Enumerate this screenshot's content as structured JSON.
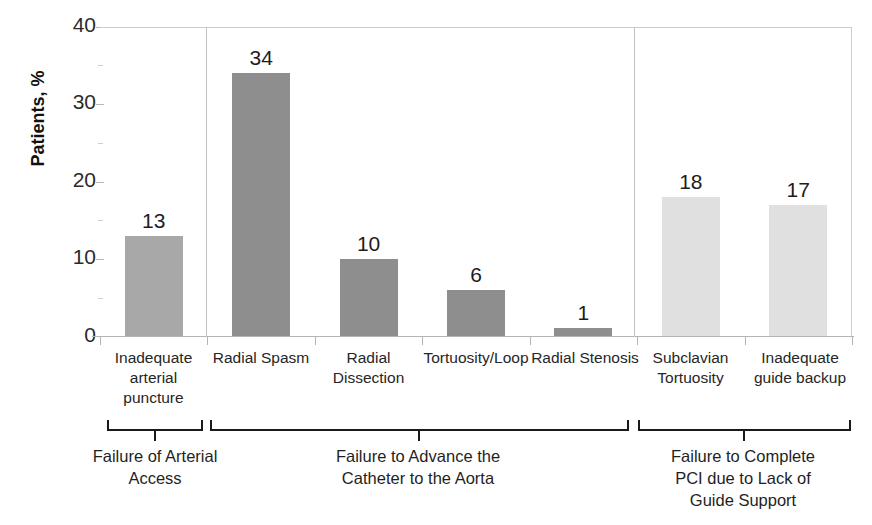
{
  "chart_data": {
    "type": "bar",
    "title": "",
    "subtitle": "",
    "xlabel": "",
    "ylabel": "Patients, %",
    "ylim": [
      0,
      40
    ],
    "ytick_labels": [
      "0",
      "10",
      "20",
      "30",
      "40"
    ],
    "ytick_values": [
      0,
      10,
      20,
      30,
      40
    ],
    "grid": false,
    "legend": "none",
    "categories": [
      "Inadequate arterial puncture",
      "Radial Spasm",
      "Radial Dissection",
      "Tortuosity/Loop",
      "Radial Stenosis",
      "Subclavian Tortuosity",
      "Inadequate guide backup"
    ],
    "values": [
      13,
      34,
      10,
      6,
      1,
      18,
      17
    ],
    "data_labels": [
      "13",
      "34",
      "10",
      "6",
      "1",
      "18",
      "17"
    ],
    "bar_colors": [
      "#a8a8a8",
      "#8e8e8e",
      "#8e8e8e",
      "#8e8e8e",
      "#8e8e8e",
      "#e0e0e0",
      "#e0e0e0"
    ],
    "groups": [
      {
        "caption": "Failure of Arterial Access",
        "category_indices": [
          0
        ]
      },
      {
        "caption": "Failure to Advance the Catheter to the Aorta",
        "category_indices": [
          1,
          2,
          3,
          4
        ]
      },
      {
        "caption": "Failure to Complete PCI due to Lack of Guide Support",
        "category_indices": [
          5,
          6
        ]
      }
    ]
  },
  "axis": {
    "y_title": "Patients, %",
    "y_ticks": [
      {
        "label": "40",
        "value": 40
      },
      {
        "label": "30",
        "value": 30
      },
      {
        "label": "20",
        "value": 20
      },
      {
        "label": "10",
        "value": 10
      },
      {
        "label": "0",
        "value": 0
      }
    ]
  },
  "categories": [
    {
      "line1": "Inadequate",
      "line2": "arterial",
      "line3": "puncture",
      "value_label": "13"
    },
    {
      "line1": "Radial Spasm",
      "line2": "",
      "line3": "",
      "value_label": "34"
    },
    {
      "line1": "Radial",
      "line2": "Dissection",
      "line3": "",
      "value_label": "10"
    },
    {
      "line1": "Tortuosity/Loop",
      "line2": "",
      "line3": "",
      "value_label": "6"
    },
    {
      "line1": "Radial Stenosis",
      "line2": "",
      "line3": "",
      "value_label": "1"
    },
    {
      "line1": "Subclavian",
      "line2": "Tortuosity",
      "line3": "",
      "value_label": "18"
    },
    {
      "line1": "Inadequate",
      "line2": "guide backup",
      "line3": "",
      "value_label": "17"
    }
  ],
  "groups": [
    {
      "caption_line1": "Failure of Arterial",
      "caption_line2": "Access",
      "caption_line3": ""
    },
    {
      "caption_line1": "Failure to Advance the",
      "caption_line2": "Catheter to the Aorta",
      "caption_line3": ""
    },
    {
      "caption_line1": "Failure to Complete",
      "caption_line2": "PCI due to Lack of",
      "caption_line3": "Guide Support"
    }
  ],
  "colors": {
    "bar_group1": "#a8a8a8",
    "bar_group2": "#8e8e8e",
    "bar_group3": "#e0e0e0",
    "axis_line": "#b4b4b4",
    "divider": "#c2c2c2",
    "text": "#1a1a1a"
  }
}
